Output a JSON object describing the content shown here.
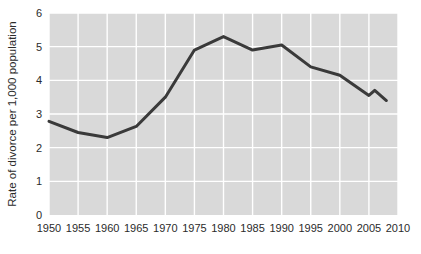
{
  "chart_data": {
    "type": "line",
    "title": "",
    "xlabel": "",
    "ylabel": "Rate of divorce per 1,000 population",
    "xlim": [
      1950,
      2010
    ],
    "ylim": [
      0,
      6
    ],
    "grid": true,
    "legend": "none",
    "plot_background": "#d9d9d9",
    "gridline_color": "#ffffff",
    "line_color": "#3a3a3a",
    "line_width": 3,
    "xticks": [
      1950,
      1955,
      1960,
      1965,
      1970,
      1975,
      1980,
      1985,
      1990,
      1995,
      2000,
      2005,
      2010
    ],
    "xtick_labels": [
      "1950",
      "1955",
      "1960",
      "1965",
      "1970",
      "1975",
      "1980",
      "1985",
      "1990",
      "1995",
      "2000",
      "2005",
      "2010"
    ],
    "yticks": [
      0,
      1,
      2,
      3,
      4,
      5,
      6
    ],
    "ytick_labels": [
      "0",
      "1",
      "2",
      "3",
      "4",
      "5",
      "6"
    ],
    "x": [
      1950,
      1955,
      1960,
      1965,
      1970,
      1975,
      1980,
      1985,
      1990,
      1995,
      2000,
      2005,
      2006,
      2008
    ],
    "values": [
      2.78,
      2.45,
      2.3,
      2.63,
      3.5,
      4.9,
      5.3,
      4.9,
      5.05,
      4.4,
      4.15,
      3.55,
      3.7,
      3.4
    ],
    "series": [
      {
        "name": "Rate of divorce per 1,000 population",
        "x": [
          1950,
          1955,
          1960,
          1965,
          1970,
          1975,
          1980,
          1985,
          1990,
          1995,
          2000,
          2005,
          2006,
          2008
        ],
        "values": [
          2.78,
          2.45,
          2.3,
          2.63,
          3.5,
          4.9,
          5.3,
          4.9,
          5.05,
          4.4,
          4.15,
          3.55,
          3.7,
          3.4
        ]
      }
    ]
  }
}
